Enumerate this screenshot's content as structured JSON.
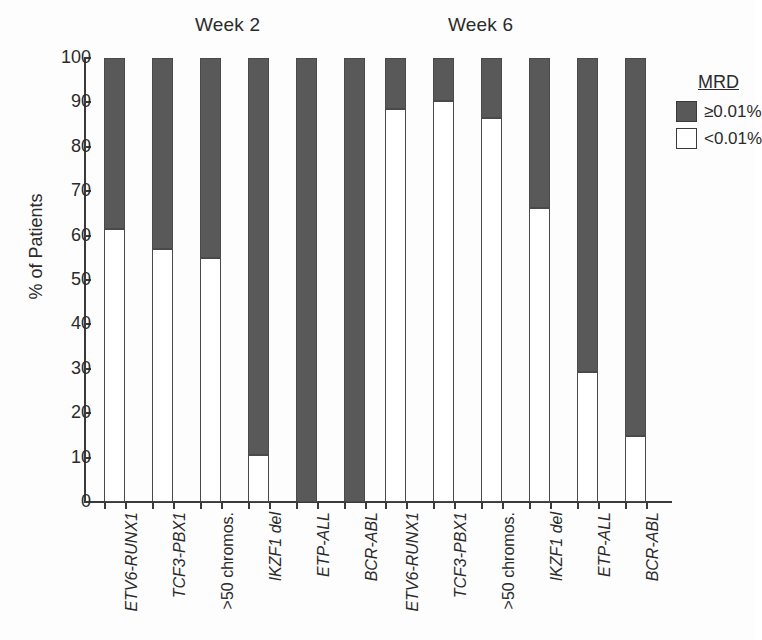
{
  "chart_data": {
    "type": "bar",
    "subtype": "stacked-100-percent",
    "title": "",
    "xlabel": "",
    "ylabel": "% of Patients",
    "ylim": [
      0,
      100
    ],
    "yticks": [
      0,
      10,
      20,
      30,
      40,
      50,
      60,
      70,
      80,
      90,
      100
    ],
    "grid": false,
    "legend": {
      "title": "MRD",
      "position": "right",
      "entries": [
        {
          "label": "≥0.01%",
          "color": "#595959"
        },
        {
          "label": "<0.01%",
          "color": "#ffffff"
        }
      ]
    },
    "groups": [
      {
        "name": "Week 2",
        "categories": [
          "ETV6-RUNX1",
          "TCF3-PBX1",
          ">50 chromos.",
          "IKZF1 del",
          "ETP-ALL",
          "BCR-ABL"
        ],
        "series": [
          {
            "name": "<0.01%",
            "values": [
              61.5,
              57.0,
              55.0,
              10.6,
              0,
              0
            ]
          },
          {
            "name": "≥0.01%",
            "values": [
              38.5,
              43.0,
              45.0,
              89.4,
              100,
              100
            ]
          }
        ]
      },
      {
        "name": "Week 6",
        "categories": [
          "ETV6-RUNX1",
          "TCF3-PBX1",
          ">50 chromos.",
          "IKZF1 del",
          "ETP-ALL",
          "BCR-ABL"
        ],
        "series": [
          {
            "name": "<0.01%",
            "values": [
              88.6,
              90.4,
              86.4,
              66.3,
              29.3,
              14.8
            ]
          },
          {
            "name": "≥0.01%",
            "values": [
              11.4,
              9.6,
              13.6,
              33.7,
              70.7,
              85.2
            ]
          }
        ]
      }
    ]
  },
  "titles": {
    "week2": "Week 2",
    "week6": "Week 6"
  },
  "axis": {
    "y_label": "% of Patients",
    "y_ticks": [
      "100",
      "90",
      "80",
      "70",
      "60",
      "50",
      "40",
      "30",
      "20",
      "10",
      "0"
    ]
  },
  "x_labels": {
    "week2": [
      "ETV6-RUNX1",
      "TCF3-PBX1",
      ">50 chromos.",
      "IKZF1 del",
      "ETP-ALL",
      "BCR-ABL"
    ],
    "week6": [
      "ETV6-RUNX1",
      "TCF3-PBX1",
      ">50 chromos.",
      "IKZF1 del",
      "ETP-ALL",
      "BCR-ABL"
    ]
  },
  "legend": {
    "title": "MRD",
    "high_label": "≥0.01%",
    "low_label": "<0.01%"
  },
  "colors": {
    "high": "#595959",
    "low": "#ffffff",
    "axis": "#3a3a3a",
    "text": "#2b2b2b"
  }
}
